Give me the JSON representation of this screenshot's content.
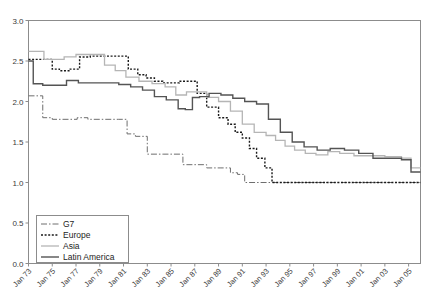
{
  "chart_data": {
    "type": "line",
    "title": "",
    "xlabel": "",
    "ylabel": "",
    "ylim": [
      0.0,
      3.0
    ],
    "ytick_values": [
      0.0,
      0.5,
      1.0,
      1.5,
      2.0,
      2.5,
      3.0
    ],
    "ytick_labels": [
      "0.0",
      "0.5",
      "1.0",
      "1.5",
      "2.0",
      "2.5",
      "3.0"
    ],
    "xlim": [
      1973,
      2006
    ],
    "xtick_values": [
      1973,
      1975,
      1977,
      1979,
      1981,
      1983,
      1985,
      1987,
      1989,
      1991,
      1993,
      1995,
      1997,
      1999,
      2001,
      2003,
      2005
    ],
    "xtick_labels": [
      "Jan 73",
      "Jan 75",
      "Jan 77",
      "Jan 79",
      "Jan 81",
      "Jan 83",
      "Jan 85",
      "Jan 87",
      "Jan 89",
      "Jan 91",
      "Jan 93",
      "Jan 95",
      "Jan 97",
      "Jan 99",
      "Jan 01",
      "Jan 03",
      "Jan 05"
    ],
    "grid": false,
    "legend_position": "lower-left",
    "step_style": "post",
    "series": [
      {
        "name": "G7",
        "color": "#6e6e6e",
        "dash": "6,2,1.5,2",
        "width": 1.0,
        "x": [
          1973.0,
          1973.6,
          1974.2,
          1975.0,
          1976.4,
          1977.1,
          1978.0,
          1980.6,
          1981.3,
          1982.0,
          1983.0,
          1984.4,
          1985.1,
          1986.0,
          1986.8,
          1988.0,
          1989.2,
          1990.0,
          1990.6,
          1991.2,
          2006.0
        ],
        "y": [
          2.07,
          2.07,
          1.8,
          1.78,
          1.78,
          1.8,
          1.78,
          1.78,
          1.6,
          1.57,
          1.35,
          1.35,
          1.35,
          1.22,
          1.22,
          1.18,
          1.18,
          1.12,
          1.1,
          1.0,
          1.0
        ]
      },
      {
        "name": "Europe",
        "color": "#1a1a1a",
        "dash": "2,1.6",
        "width": 1.4,
        "x": [
          1973.0,
          1974.1,
          1975.0,
          1975.6,
          1976.4,
          1977.3,
          1978.2,
          1979.0,
          1981.4,
          1982.2,
          1982.9,
          1983.6,
          1984.3,
          1985.0,
          1985.7,
          1986.4,
          1987.2,
          1988.0,
          1989.0,
          1989.8,
          1990.4,
          1991.0,
          1991.6,
          1992.2,
          1992.9,
          1993.5,
          2006.0
        ],
        "y": [
          2.52,
          2.52,
          2.4,
          2.38,
          2.4,
          2.55,
          2.56,
          2.56,
          2.4,
          2.33,
          2.29,
          2.25,
          2.23,
          2.23,
          2.25,
          2.25,
          2.1,
          1.93,
          1.8,
          1.72,
          1.62,
          1.55,
          1.42,
          1.3,
          1.18,
          1.0,
          1.0
        ]
      },
      {
        "name": "Asia",
        "color": "#b5b5b5",
        "dash": "",
        "width": 1.3,
        "x": [
          1973.0,
          1973.5,
          1974.3,
          1975.2,
          1976.0,
          1977.0,
          1978.2,
          1979.4,
          1980.3,
          1981.2,
          1982.3,
          1983.4,
          1984.5,
          1985.4,
          1986.3,
          1987.2,
          1988.0,
          1989.0,
          1990.0,
          1991.0,
          1992.0,
          1993.0,
          1993.8,
          1994.6,
          1995.4,
          1996.3,
          1997.2,
          1998.2,
          1999.2,
          2000.4,
          2001.6,
          2003.0,
          2004.4,
          2005.2,
          2006.0
        ],
        "y": [
          2.62,
          2.62,
          2.52,
          2.52,
          2.55,
          2.58,
          2.58,
          2.45,
          2.38,
          2.3,
          2.25,
          2.22,
          2.18,
          2.08,
          2.12,
          2.12,
          2.05,
          2.0,
          1.88,
          1.72,
          1.62,
          1.58,
          1.52,
          1.45,
          1.4,
          1.36,
          1.34,
          1.38,
          1.36,
          1.33,
          1.33,
          1.32,
          1.3,
          1.18,
          1.18
        ]
      },
      {
        "name": "Latin America",
        "color": "#545454",
        "dash": "",
        "width": 1.4,
        "x": [
          1973.0,
          1973.4,
          1974.2,
          1975.3,
          1976.2,
          1977.2,
          1978.4,
          1979.6,
          1980.6,
          1981.6,
          1982.6,
          1983.6,
          1984.6,
          1985.6,
          1986.2,
          1986.8,
          1987.4,
          1988.2,
          1989.2,
          1990.2,
          1991.2,
          1992.2,
          1993.2,
          1994.2,
          1995.2,
          1996.2,
          1997.3,
          1998.4,
          1999.6,
          2000.8,
          2002.0,
          2003.2,
          2004.4,
          2005.2,
          2006.0
        ],
        "y": [
          2.5,
          2.22,
          2.2,
          2.2,
          2.26,
          2.23,
          2.23,
          2.23,
          2.21,
          2.18,
          2.14,
          2.06,
          2.02,
          1.91,
          1.9,
          2.05,
          2.06,
          2.1,
          2.08,
          2.04,
          2.0,
          1.97,
          1.78,
          1.62,
          1.5,
          1.44,
          1.4,
          1.42,
          1.4,
          1.36,
          1.3,
          1.3,
          1.28,
          1.13,
          1.13
        ]
      }
    ]
  },
  "legend": {
    "items": [
      {
        "label": "G7"
      },
      {
        "label": "Europe"
      },
      {
        "label": "Asia"
      },
      {
        "label": "Latin America"
      }
    ]
  }
}
